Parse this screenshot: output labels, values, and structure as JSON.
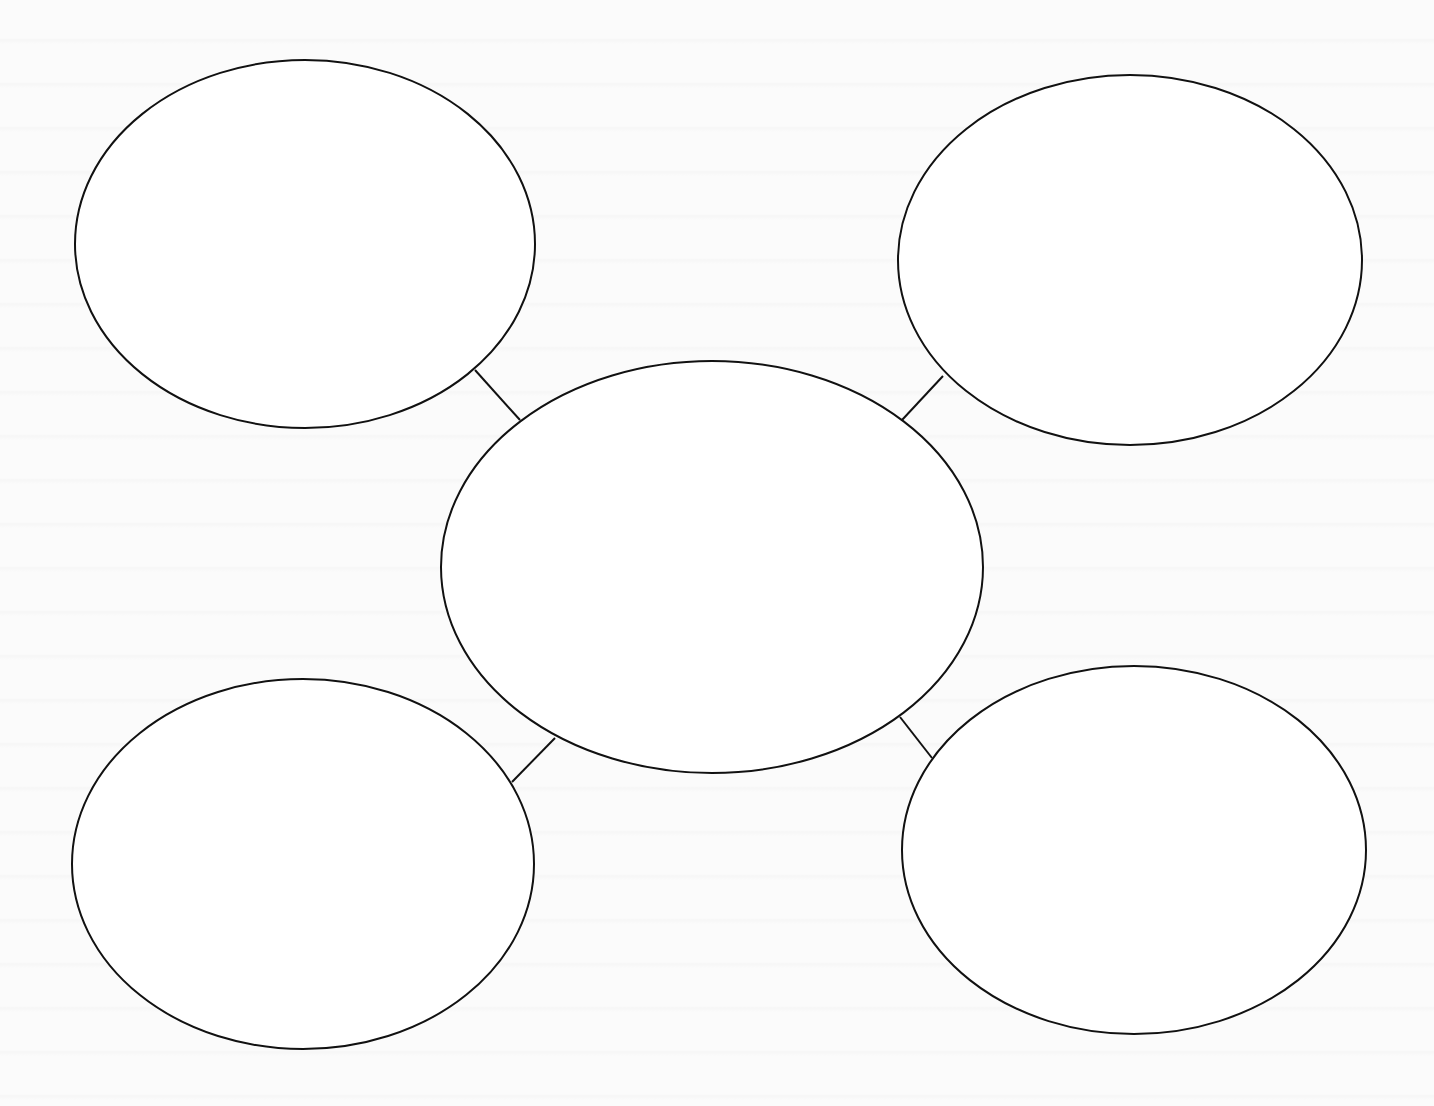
{
  "diagram": {
    "type": "bubble-map",
    "stroke_color": "#111111",
    "fill_color": "#ffffff",
    "background_color": "#fbfbfb",
    "center": {
      "id": "center",
      "label": "",
      "cx": 712,
      "cy": 567,
      "rx": 271,
      "ry": 206
    },
    "nodes": [
      {
        "id": "top-left",
        "label": "",
        "cx": 305,
        "cy": 244,
        "rx": 230,
        "ry": 184
      },
      {
        "id": "top-right",
        "label": "",
        "cx": 1130,
        "cy": 260,
        "rx": 232,
        "ry": 185
      },
      {
        "id": "bottom-left",
        "label": "",
        "cx": 303,
        "cy": 864,
        "rx": 231,
        "ry": 185
      },
      {
        "id": "bottom-right",
        "label": "",
        "cx": 1134,
        "cy": 850,
        "rx": 232,
        "ry": 184
      }
    ],
    "connectors": [
      {
        "from": "center",
        "to": "top-left",
        "x1": 520,
        "y1": 420,
        "x2": 475,
        "y2": 370
      },
      {
        "from": "center",
        "to": "top-right",
        "x1": 902,
        "y1": 420,
        "x2": 943,
        "y2": 376
      },
      {
        "from": "center",
        "to": "bottom-left",
        "x1": 555,
        "y1": 738,
        "x2": 512,
        "y2": 782
      },
      {
        "from": "center",
        "to": "bottom-right",
        "x1": 900,
        "y1": 717,
        "x2": 932,
        "y2": 758
      }
    ]
  }
}
